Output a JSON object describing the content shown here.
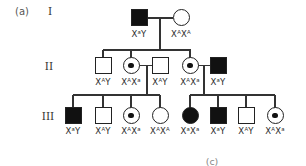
{
  "figure": {
    "panel_label": "(a)",
    "bottom_label": "(c)",
    "type": "pedigree-diagram",
    "trait": "X-linked recessive (filled = affected, center dot = carrier)"
  },
  "colors": {
    "background": "#ffffff",
    "line": "#333333",
    "symbol_border": "#222222",
    "symbol_fill": "#111111",
    "text": "#2b2b2b"
  },
  "generations": [
    {
      "numeral": "I",
      "members": [
        {
          "sex": "male",
          "affected": true,
          "carrier": false,
          "genotype": "XᵃY"
        },
        {
          "sex": "female",
          "affected": false,
          "carrier": false,
          "genotype": "XᴬXᴬ"
        }
      ]
    },
    {
      "numeral": "II",
      "members": [
        {
          "sex": "male",
          "affected": false,
          "carrier": false,
          "genotype": "XᴬY"
        },
        {
          "sex": "female",
          "affected": false,
          "carrier": true,
          "genotype": "XᴬXᵃ"
        },
        {
          "sex": "male",
          "affected": false,
          "carrier": false,
          "genotype": "XᴬY"
        },
        {
          "sex": "female",
          "affected": false,
          "carrier": true,
          "genotype": "XᴬXᵃ"
        },
        {
          "sex": "male",
          "affected": true,
          "carrier": false,
          "genotype": "XᵃY"
        }
      ]
    },
    {
      "numeral": "III",
      "members": [
        {
          "sex": "male",
          "affected": true,
          "carrier": false,
          "genotype": "XᵃY"
        },
        {
          "sex": "male",
          "affected": false,
          "carrier": false,
          "genotype": "XᴬY"
        },
        {
          "sex": "female",
          "affected": false,
          "carrier": true,
          "genotype": "XᴬXᵃ"
        },
        {
          "sex": "female",
          "affected": false,
          "carrier": false,
          "genotype": "XᴬXᴬ"
        },
        {
          "sex": "female",
          "affected": true,
          "carrier": false,
          "genotype": "XᵃXᵃ"
        },
        {
          "sex": "male",
          "affected": true,
          "carrier": false,
          "genotype": "XᵃY"
        },
        {
          "sex": "male",
          "affected": false,
          "carrier": false,
          "genotype": "XᴬY"
        },
        {
          "sex": "female",
          "affected": false,
          "carrier": true,
          "genotype": "XᴬXᵃ"
        }
      ]
    }
  ]
}
